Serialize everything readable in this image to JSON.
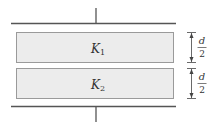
{
  "diagram": {
    "type": "parallel-plate capacitor with two stacked dielectric slabs",
    "slabs": [
      {
        "symbol": "K",
        "subscript": "1"
      },
      {
        "symbol": "K",
        "subscript": "2"
      }
    ],
    "dimensions": [
      {
        "numerator": "d",
        "denominator": "2"
      },
      {
        "numerator": "d",
        "denominator": "2"
      }
    ],
    "colors": {
      "plate": "#555555",
      "slab_fill": "#ececec",
      "slab_stroke": "#9a9a9a",
      "text": "#333333",
      "dimension": "#444444"
    }
  }
}
